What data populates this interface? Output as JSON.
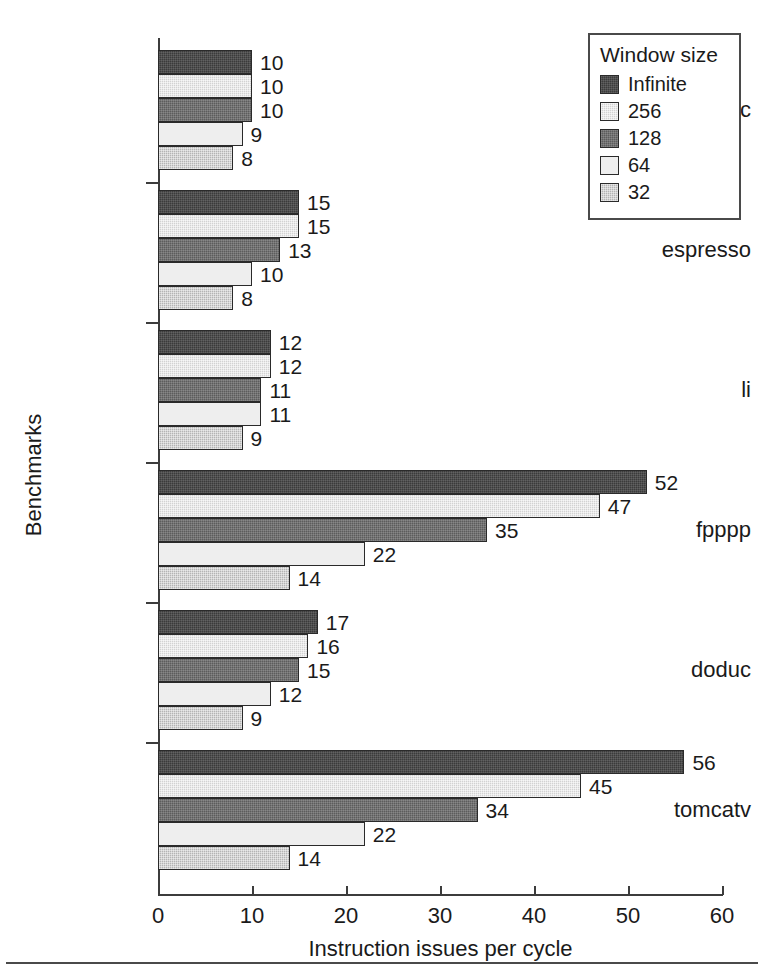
{
  "legend": {
    "title": "Window size",
    "entries": [
      {
        "label": "Infinite",
        "swatch": "dark-charcoal-dither",
        "color": "#3b3b3b"
      },
      {
        "label": "256",
        "swatch": "light-grey-dither",
        "color": "#d2d2d2"
      },
      {
        "label": "128",
        "swatch": "mid-grey-dither",
        "color": "#5c5c5c"
      },
      {
        "label": "64",
        "swatch": "near-white",
        "color": "#eeeeee"
      },
      {
        "label": "32",
        "swatch": "grey-dither",
        "color": "#b4b4b4"
      }
    ]
  },
  "axes": {
    "x_title": "Instruction issues per cycle",
    "y_title": "Benchmarks",
    "x_ticks": [
      "0",
      "10",
      "20",
      "30",
      "40",
      "50",
      "60"
    ]
  },
  "chart_data": {
    "type": "bar",
    "orientation": "horizontal",
    "title": "",
    "xlabel": "Instruction issues per cycle",
    "ylabel": "Benchmarks",
    "xlim": [
      0,
      60
    ],
    "xticks": [
      0,
      10,
      20,
      30,
      40,
      50,
      60
    ],
    "grid": false,
    "legend_position": "top-right",
    "legend_title": "Window size",
    "categories": [
      "gcc",
      "espresso",
      "li",
      "fpppp",
      "doduc",
      "tomcatv"
    ],
    "series": [
      {
        "name": "Infinite",
        "color": "#3b3b3b",
        "values": [
          10,
          15,
          12,
          52,
          17,
          56
        ]
      },
      {
        "name": "256",
        "color": "#d2d2d2",
        "values": [
          10,
          15,
          12,
          47,
          16,
          45
        ]
      },
      {
        "name": "128",
        "color": "#5c5c5c",
        "values": [
          10,
          13,
          11,
          35,
          15,
          34
        ]
      },
      {
        "name": "64",
        "color": "#eeeeee",
        "values": [
          9,
          10,
          11,
          22,
          12,
          22
        ]
      },
      {
        "name": "32",
        "color": "#b4b4b4",
        "values": [
          8,
          8,
          9,
          14,
          9,
          14
        ]
      }
    ],
    "data_labels": [
      {
        "category": "gcc",
        "labels": [
          "10",
          "10",
          "10",
          "9",
          "8"
        ]
      },
      {
        "category": "espresso",
        "labels": [
          "15",
          "15",
          "13",
          "10",
          "8"
        ]
      },
      {
        "category": "li",
        "labels": [
          "12",
          "12",
          "11",
          "11",
          "9"
        ]
      },
      {
        "category": "fpppp",
        "labels": [
          "52",
          "47",
          "35",
          "22",
          "14"
        ]
      },
      {
        "category": "doduc",
        "labels": [
          "17",
          "16",
          "15",
          "12",
          "9"
        ]
      },
      {
        "category": "tomcatv",
        "labels": [
          "56",
          "45",
          "34",
          "22",
          "14"
        ]
      }
    ]
  }
}
